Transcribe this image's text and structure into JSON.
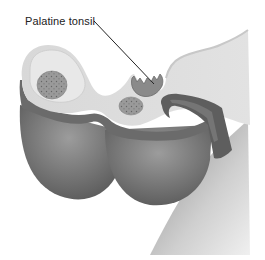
{
  "diagram": {
    "labels": [
      {
        "text": "Palatine tonsil",
        "target": "palatine-tonsil",
        "position": {
          "x": 25,
          "y": 15
        },
        "leader_line": {
          "from": [
            94,
            21
          ],
          "to": [
            154,
            84
          ]
        }
      }
    ],
    "colors": {
      "background": "#ffffff",
      "mucosa_light": "#dcdcdc",
      "mucosa_mid": "#c8c8c8",
      "tissue_dark_band": "#6e6e6e",
      "lobe_fill_top": "#8f8f8f",
      "lobe_fill_bottom": "#5a5a5a",
      "gland_fill": "#9a9a9a",
      "gland_dots": "#6a6a6a",
      "tonsil_fill": "#8a8a8a",
      "leader_line": "#222222",
      "label_text": "#222222"
    }
  }
}
